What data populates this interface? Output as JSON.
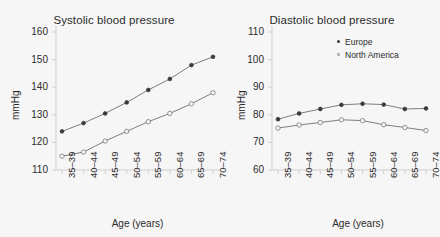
{
  "figure": {
    "background": "#f6f6f6",
    "ink": "#2b2b2b",
    "line_color": "#6f6f6f"
  },
  "legend": {
    "position": "top-right-of-diastolic-panel",
    "entries": [
      {
        "label": "Europe",
        "marker": "filled-circle",
        "color": "#3a3a3a"
      },
      {
        "label": "North America",
        "marker": "open-circle",
        "color": "#7a7a7a"
      }
    ]
  },
  "chart_data": [
    {
      "type": "line",
      "title": "Systolic blood pressure",
      "xlabel": "Age (years)",
      "ylabel": "mmHg",
      "categories": [
        "35–39",
        "40–44",
        "45–49",
        "50–54",
        "55–59",
        "60–64",
        "65–69",
        "70–74"
      ],
      "yticks": [
        110,
        120,
        130,
        140,
        150,
        160
      ],
      "ylim": [
        110,
        160
      ],
      "grid": false,
      "legend": false,
      "series": [
        {
          "name": "Europe",
          "marker": "filled-circle",
          "values": [
            124,
            127,
            130.5,
            134.5,
            139,
            143,
            148,
            151
          ]
        },
        {
          "name": "North America",
          "marker": "open-circle",
          "values": [
            115,
            116.5,
            120.5,
            124,
            127.5,
            130.5,
            134,
            138
          ]
        }
      ]
    },
    {
      "type": "line",
      "title": "Diastolic blood pressure",
      "xlabel": "Age (years)",
      "ylabel": "mmHg",
      "categories": [
        "35–39",
        "40–44",
        "45–49",
        "50–54",
        "55–59",
        "60–64",
        "65–69",
        "70–74"
      ],
      "yticks": [
        60,
        70,
        80,
        90,
        100,
        110
      ],
      "ylim": [
        60,
        110
      ],
      "grid": false,
      "legend": true,
      "series": [
        {
          "name": "Europe",
          "marker": "filled-circle",
          "values": [
            78.4,
            80.5,
            82.1,
            83.6,
            84.0,
            83.7,
            82.1,
            82.3
          ]
        },
        {
          "name": "North America",
          "marker": "open-circle",
          "values": [
            75.2,
            76.3,
            77.2,
            78.2,
            77.9,
            76.4,
            75.4,
            74.3
          ]
        }
      ]
    }
  ]
}
